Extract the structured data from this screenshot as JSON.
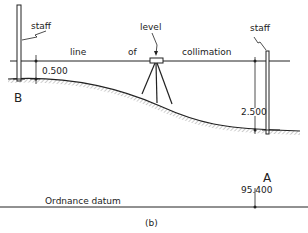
{
  "diagram": {
    "caption": "(b)",
    "labels": {
      "staff_left": "staff",
      "staff_right": "staff",
      "level": "level",
      "line_word1": "line",
      "line_word2": "of",
      "line_word3": "collimation",
      "point_b": "B",
      "point_a": "A",
      "datum": "Ordnance  datum"
    },
    "measurements": {
      "reading_b": "0.500",
      "reading_a": "2.500",
      "reduced_level_a": "95.400"
    },
    "colors": {
      "line": "#222222",
      "hatch": "#888888"
    }
  }
}
